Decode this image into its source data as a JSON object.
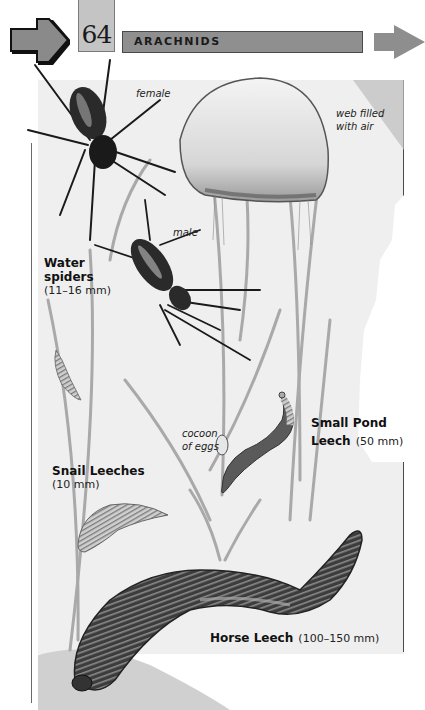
{
  "header": {
    "page_number": "64",
    "chapter_title": "ARACHNIDS",
    "prev_arrow_icon": "arrow-right-outlined-icon",
    "next_arrow_icon": "arrow-right-gray-icon",
    "colors": {
      "chapter_bar": "#8f8f8f",
      "page_tab": "#c4c4c4",
      "arrow_fill": "#8a8a8a",
      "arrow_outline": "#111111"
    }
  },
  "illustration": {
    "annotations": {
      "female": "female",
      "male": "male",
      "web_line1": "web filled",
      "web_line2": "with air",
      "cocoon_line1": "cocoon",
      "cocoon_line2": "of eggs"
    },
    "species": [
      {
        "name_line1": "Water",
        "name_line2": "spiders",
        "size": "(11–16 mm)"
      },
      {
        "name_line1": "Small Pond",
        "name_line2": "Leech",
        "size": "(50 mm)"
      },
      {
        "name_line1": "Snail Leeches",
        "size": "(10 mm)"
      },
      {
        "name_line1": "Horse Leech",
        "size": "(100–150 mm)"
      }
    ]
  }
}
